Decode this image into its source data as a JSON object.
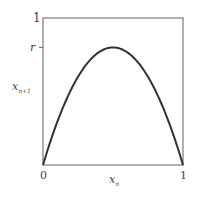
{
  "chart_data": {
    "type": "line",
    "title": "",
    "xlabel": "x_n",
    "ylabel": "x_{n+1}",
    "xlabel_main": "x",
    "xlabel_sub": "n",
    "ylabel_main": "x",
    "ylabel_sub": "n+1",
    "x_ticks": [
      "0",
      "1"
    ],
    "y_ticks": [
      "1",
      "r"
    ],
    "xlim": [
      0,
      1
    ],
    "ylim": [
      0,
      1
    ],
    "r_value": 0.8,
    "grid": false,
    "legend": null,
    "series": [
      {
        "name": "logistic map x_{n+1} = 4r x_n (1 - x_n)",
        "x": [
          0,
          0.1,
          0.2,
          0.3,
          0.4,
          0.5,
          0.6,
          0.7,
          0.8,
          0.9,
          1.0
        ],
        "y": [
          0,
          0.288,
          0.512,
          0.672,
          0.768,
          0.8,
          0.768,
          0.672,
          0.512,
          0.288,
          0
        ]
      }
    ]
  },
  "labels": {
    "x_tick_0": "0",
    "x_tick_1": "1",
    "y_tick_1": "1",
    "y_tick_r": "r",
    "x_axis_main": "x",
    "x_axis_sub": "n",
    "y_axis_main": "x",
    "y_axis_sub": "n+1"
  },
  "colors": {
    "frame": "#7a7a7a",
    "curve": "#333333",
    "text": "#444444"
  }
}
